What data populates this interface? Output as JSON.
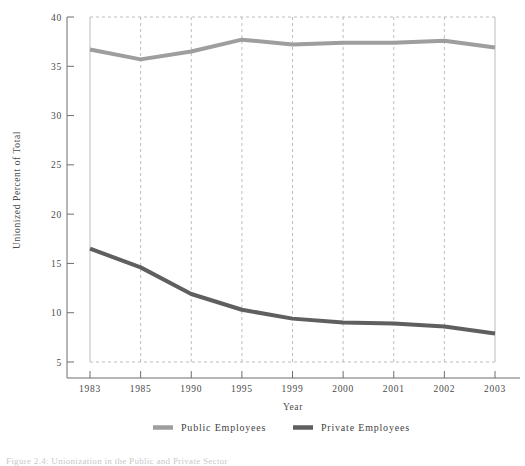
{
  "chart_data": {
    "type": "line",
    "title": "",
    "xlabel": "Year",
    "ylabel": "Unionized Percent of Total",
    "categories": [
      "1983",
      "1985",
      "1990",
      "1995",
      "1999",
      "2000",
      "2001",
      "2002",
      "2003"
    ],
    "ylim": [
      5,
      40
    ],
    "ytick_labels": [
      "5",
      "10",
      "15",
      "20",
      "25",
      "30",
      "35",
      "40"
    ],
    "ytick_values": [
      5,
      10,
      15,
      20,
      25,
      30,
      35,
      40
    ],
    "grid": true,
    "grid_style": "dashed",
    "legend_position": "bottom",
    "series": [
      {
        "name": "Public Employees",
        "color": "#9e9e9e",
        "values": [
          36.7,
          35.7,
          36.5,
          37.7,
          37.2,
          37.4,
          37.4,
          37.6,
          36.9
        ]
      },
      {
        "name": "Private Employees",
        "color": "#5f5f5f",
        "values": [
          16.5,
          14.6,
          11.9,
          10.3,
          9.4,
          9.0,
          8.9,
          8.6,
          7.9
        ]
      }
    ]
  },
  "axes": {
    "x_title": "Year",
    "y_title": "Unionized Percent of Total"
  },
  "legend": {
    "entries": [
      {
        "label": "Public Employees",
        "color": "#9e9e9e"
      },
      {
        "label": "Private Employees",
        "color": "#5f5f5f"
      }
    ]
  },
  "caption": {
    "text": "Figure 2.4: Unionization in the Public and Private Sector"
  },
  "colors": {
    "public": "#9e9e9e",
    "private": "#5f5f5f",
    "axis": "#6e6e6e",
    "grid": "#bdbdbd",
    "text": "#4a4a4a"
  }
}
